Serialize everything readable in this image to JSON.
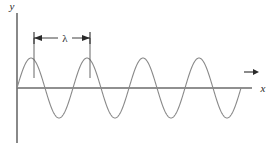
{
  "figure": {
    "background_color": "#ffffff"
  },
  "axes": {
    "y_label": "y",
    "x_label": "x",
    "axis_color": "#6b6b6b",
    "y_axis": {
      "x": 17,
      "y_top": 13,
      "y_bottom": 143
    },
    "x_axis": {
      "y": 88,
      "x_start": 17,
      "x_end": 252
    }
  },
  "annotation": {
    "wavelength_symbol": "λ",
    "measure_line_y": 38,
    "measure_x_start": 34,
    "measure_x_end": 90,
    "label_x": 65,
    "drop_line_color": "#555555",
    "drop_line_top": 38,
    "drop_line_bottom": 78
  },
  "direction_arrow": {
    "name": "propagation-direction-arrow",
    "x_start": 244,
    "x_end": 258,
    "y": 72,
    "color": "#2a2a2a"
  },
  "chart_data": {
    "type": "line",
    "xlabel": "x",
    "ylabel": "y",
    "wave": {
      "form": "sine",
      "amplitude_px": 30,
      "wavelength_px": 56,
      "cycles": 4,
      "phase": 0,
      "x_start_px": 17,
      "x_end_px": 241,
      "baseline_y_px": 88,
      "stroke_color": "#8a8a8a",
      "stroke_width": 1.1
    },
    "peaks_px": [
      {
        "x": 31,
        "y": 58
      },
      {
        "x": 87,
        "y": 58
      },
      {
        "x": 143,
        "y": 58
      },
      {
        "x": 199,
        "y": 58
      }
    ],
    "troughs_px": [
      {
        "x": 59,
        "y": 118
      },
      {
        "x": 115,
        "y": 118
      },
      {
        "x": 171,
        "y": 118
      },
      {
        "x": 227,
        "y": 118
      }
    ],
    "zero_crossings_px": [
      17,
      45,
      73,
      101,
      129,
      157,
      185,
      213,
      241
    ],
    "grid": false,
    "legend": false
  }
}
